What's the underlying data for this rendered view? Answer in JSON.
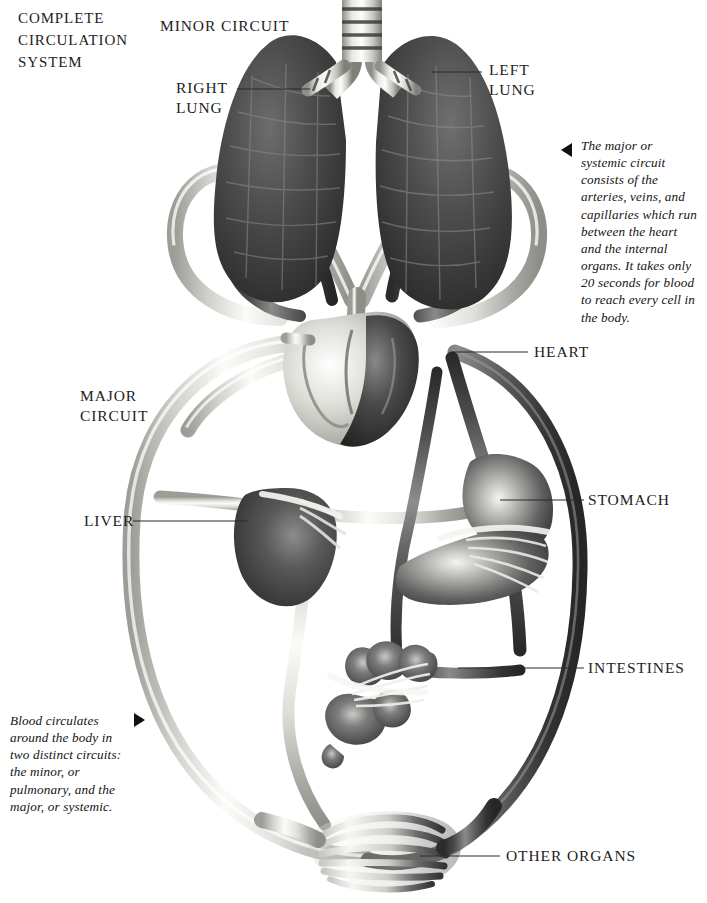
{
  "page": {
    "title": "COMPLETE\nCIRCULATION\nSYSTEM",
    "background_color": "#ffffff",
    "width": 707,
    "height": 903
  },
  "labels": {
    "minor_circuit": "MINOR CIRCUIT",
    "right_lung": "RIGHT\nLUNG",
    "left_lung": "LEFT\nLUNG",
    "heart": "HEART",
    "major_circuit": "MAJOR\nCIRCUIT",
    "liver": "LIVER",
    "stomach": "STOMACH",
    "intestines": "INTESTINES",
    "other_organs": "OTHER ORGANS"
  },
  "captions": {
    "major_circuit_note": "The major or systemic circuit consists of the arteries, veins, and capillaries which run between the heart and the internal organs. It takes only 20 seconds for blood to reach every cell in the body.",
    "two_circuits_note": "Blood circulates around the body in two distinct circuits: the minor, or pulmonary, and the major, or systemic."
  },
  "colors": {
    "artery_light": "#f2f2f0",
    "artery_mid": "#b9b9b5",
    "vein_dark": "#3c3c3c",
    "vein_mid": "#6e6e6e",
    "lung_dark": "#3a3a3a",
    "organ_mid": "#585858",
    "leader_line": "#2a2a2a",
    "text": "#1d1d1d"
  }
}
